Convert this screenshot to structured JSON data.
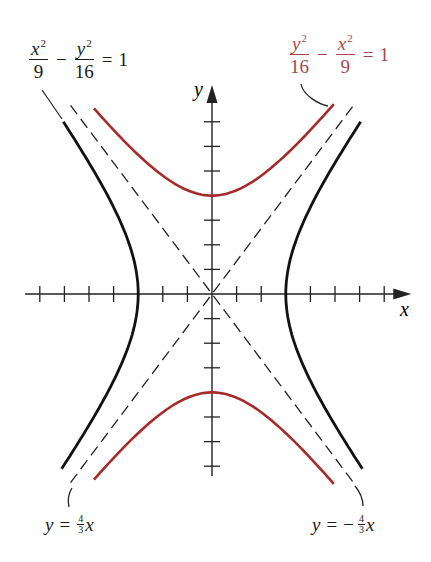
{
  "figure": {
    "labels": {
      "black_hyperbola": {
        "x_num": "x",
        "x_exp": "2",
        "x_den": "9",
        "minus": "−",
        "y_num": "y",
        "y_exp": "2",
        "y_den": "16",
        "equals": "=",
        "rhs": "1",
        "color": "#1a1a1a"
      },
      "red_hyperbola": {
        "y_num": "y",
        "y_exp": "2",
        "y_den": "16",
        "minus": "−",
        "x_num": "x",
        "x_exp": "2",
        "x_den": "9",
        "equals": "=",
        "rhs": "1",
        "color": "#a3484a"
      },
      "asymptote_pos": {
        "y": "y",
        "equals": "=",
        "frac_num": "4",
        "frac_den": "3",
        "x": "x",
        "sign": ""
      },
      "asymptote_neg": {
        "y": "y",
        "equals": "=",
        "frac_num": "4",
        "frac_den": "3",
        "x": "x",
        "sign": "−"
      },
      "x_axis": "x",
      "y_axis": "y"
    },
    "colors": {
      "black_curve": "#111111",
      "red_curve": "#a52a2a",
      "axes": "#222222",
      "asymptote": "#222222"
    },
    "geometry": {
      "origin": [
        212,
        294
      ],
      "unit_px": 24.6,
      "x_ticks": [
        -7,
        -6,
        -5,
        -4,
        -2,
        -1,
        1,
        2,
        4,
        5,
        6,
        7
      ],
      "y_ticks": [
        -7,
        -6,
        -5,
        -3,
        -2,
        -1,
        1,
        2,
        3,
        5,
        6,
        7
      ],
      "x_axis_range": [
        -7.6,
        8.1
      ],
      "y_axis_range": [
        -7.4,
        8.5
      ],
      "black_y_range": [
        -7.1,
        7.0
      ],
      "red_x_range": [
        -4.8,
        4.95
      ],
      "asymptote_x_range": [
        -5.75,
        5.75
      ]
    }
  },
  "chart_data": {
    "type": "line",
    "title": "",
    "xlabel": "x",
    "ylabel": "y",
    "grid": false,
    "series": [
      {
        "name": "x^2/9 - y^2/16 = 1",
        "kind": "hyperbola (horizontal)",
        "a": 3,
        "b": 4,
        "color": "#111111",
        "vertices": [
          [
            -3,
            0
          ],
          [
            3,
            0
          ]
        ]
      },
      {
        "name": "y^2/16 - x^2/9 = 1",
        "kind": "hyperbola (vertical)",
        "a": 4,
        "b": 3,
        "color": "#a52a2a",
        "vertices": [
          [
            0,
            -4
          ],
          [
            0,
            4
          ]
        ]
      },
      {
        "name": "y = 4/3 x",
        "kind": "asymptote (dashed)",
        "slope": 1.3333
      },
      {
        "name": "y = -4/3 x",
        "kind": "asymptote (dashed)",
        "slope": -1.3333
      }
    ],
    "x_ticks": [
      -7,
      -6,
      -5,
      -4,
      -3,
      -2,
      -1,
      1,
      2,
      3,
      4,
      5,
      6,
      7
    ],
    "y_ticks": [
      -7,
      -6,
      -5,
      -4,
      -3,
      -2,
      -1,
      1,
      2,
      3,
      4,
      5,
      6,
      7
    ],
    "xlim": [
      -7.6,
      8.1
    ],
    "ylim": [
      -7.4,
      8.5
    ]
  }
}
